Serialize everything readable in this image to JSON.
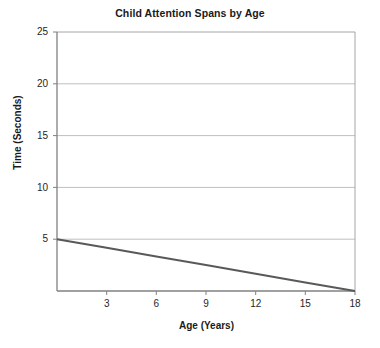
{
  "chart_data": {
    "type": "line",
    "title": "Child Attention Spans by Age",
    "xlabel": "Age (Years)",
    "ylabel": "Time (Seconds)",
    "xlim": [
      0,
      18
    ],
    "ylim": [
      0,
      25
    ],
    "xticks": [
      3,
      6,
      9,
      12,
      15,
      18
    ],
    "yticks": [
      5,
      10,
      15,
      20,
      25
    ],
    "grid": "horizontal",
    "legend": "none",
    "series": [
      {
        "name": "Attention Span",
        "color": "#595959",
        "x": [
          0,
          3,
          6,
          9,
          12,
          15,
          18
        ],
        "values": [
          5,
          4.17,
          3.33,
          2.5,
          1.67,
          0.83,
          0
        ]
      }
    ]
  },
  "axes": {
    "y_tick_labels": [
      "25",
      "20",
      "15",
      "10",
      "5"
    ],
    "x_tick_labels": [
      "3",
      "6",
      "9",
      "12",
      "15",
      "18"
    ]
  },
  "style": {
    "line_color": "#595959",
    "grid_color": "#bfbfbf",
    "axis_color": "#808080",
    "background": "#ffffff"
  }
}
